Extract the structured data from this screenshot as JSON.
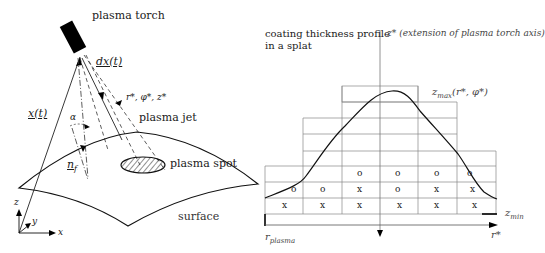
{
  "left_panel": {
    "title": "plasma torch",
    "labels": {
      "position_vector": "x(t)",
      "direction_vector": "dx(t)",
      "local_coords": "r*, φ*, z*",
      "angle": "α",
      "plasma_jet": "plasma jet",
      "normal": "n",
      "normal_sub": "f",
      "plasma_spot": "plasma spot",
      "surface": "surface"
    },
    "axes": {
      "z": "z",
      "y": "y",
      "x": "x"
    }
  },
  "right_panel": {
    "title_line1": "coating thickness profile",
    "title_line2": "in a splat",
    "z_axis_label": "z*",
    "z_axis_note": "(extension of plasma torch axis)",
    "zmax_label": "z",
    "zmax_sub": "max",
    "zmax_args": "(r*, φ*)",
    "zmin_label": "z",
    "zmin_sub": "min",
    "r_plasma_label": "r",
    "r_plasma_sub": "plasma",
    "r_axis_label": "r*",
    "grid_rows": [
      [
        "",
        "",
        "o",
        "o",
        "o",
        "o"
      ],
      [
        "o",
        "o",
        "x",
        "o",
        "x",
        "x"
      ],
      [
        "x",
        "x",
        "x",
        "x",
        "x",
        "x"
      ]
    ]
  }
}
